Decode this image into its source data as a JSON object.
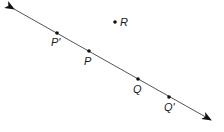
{
  "diagram": {
    "type": "geometry-line-with-points",
    "line": {
      "start": [
        14,
        9
      ],
      "end": [
        211,
        120
      ],
      "arrows": "both",
      "color": "#555555"
    },
    "points": [
      {
        "id": "P_prime",
        "label": "P'",
        "x": 57,
        "y": 33,
        "label_x": 51,
        "label_y": 37,
        "on_line": true
      },
      {
        "id": "P",
        "label": "P",
        "x": 89,
        "y": 51,
        "label_x": 84,
        "label_y": 56,
        "on_line": true
      },
      {
        "id": "Q",
        "label": "Q",
        "x": 138,
        "y": 79,
        "label_x": 133,
        "label_y": 84,
        "on_line": true
      },
      {
        "id": "Q_prime",
        "label": "Q'",
        "x": 169,
        "y": 97,
        "label_x": 164,
        "label_y": 102,
        "on_line": true
      },
      {
        "id": "R",
        "label": "R",
        "x": 115,
        "y": 22,
        "label_x": 120,
        "label_y": 17,
        "on_line": false
      }
    ],
    "point_color": "#111111"
  }
}
